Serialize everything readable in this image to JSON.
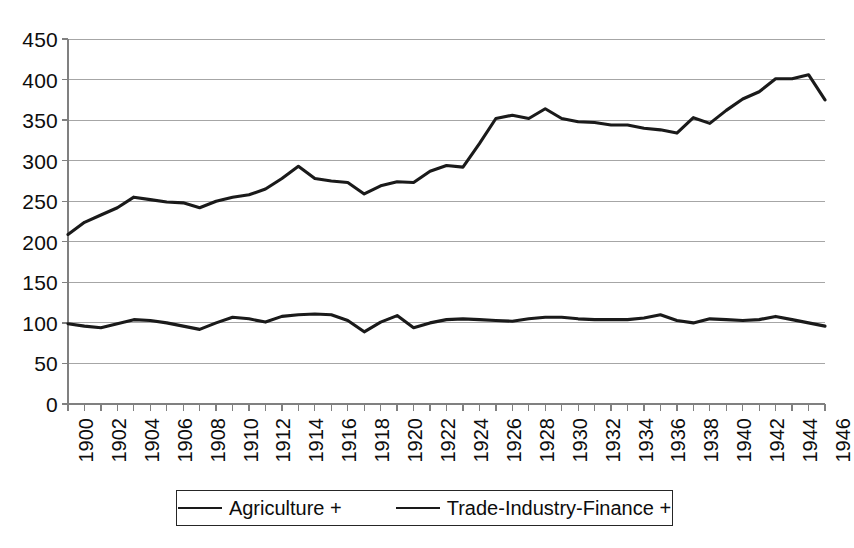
{
  "chart_data": {
    "type": "line",
    "title": "",
    "subtitle": "",
    "xlabel": "",
    "ylabel": "",
    "xlim": [
      1900,
      1946
    ],
    "ylim": [
      0,
      450
    ],
    "y_ticks": [
      0,
      50,
      100,
      150,
      200,
      250,
      300,
      350,
      400,
      450
    ],
    "y_tick_labels": [
      "0",
      "50",
      "100",
      "150",
      "200",
      "250",
      "300",
      "350",
      "400",
      "450"
    ],
    "x_tick_labels": [
      "1900",
      "1902",
      "1904",
      "1906",
      "1908",
      "1910",
      "1912",
      "1914",
      "1916",
      "1918",
      "1920",
      "1922",
      "1924",
      "1926",
      "1928",
      "1930",
      "1932",
      "1934",
      "1936",
      "1938",
      "1940",
      "1942",
      "1944",
      "1946"
    ],
    "x": [
      1900,
      1901,
      1902,
      1903,
      1904,
      1905,
      1906,
      1907,
      1908,
      1909,
      1910,
      1911,
      1912,
      1913,
      1914,
      1915,
      1916,
      1917,
      1918,
      1919,
      1920,
      1921,
      1922,
      1923,
      1924,
      1925,
      1926,
      1927,
      1928,
      1929,
      1930,
      1931,
      1932,
      1933,
      1934,
      1935,
      1936,
      1937,
      1938,
      1939,
      1940,
      1941,
      1942,
      1943,
      1944,
      1945,
      1946
    ],
    "grid": true,
    "grid_axis": "y",
    "legend_position": "bottom",
    "line_color": "#1a1a1a",
    "grid_color": "#a6a6a6",
    "axis_color": "#808080",
    "series": [
      {
        "name": "Agriculture +",
        "values": [
          99,
          96,
          94,
          99,
          104,
          103,
          100,
          96,
          92,
          100,
          107,
          105,
          101,
          108,
          110,
          111,
          110,
          103,
          89,
          101,
          109,
          94,
          100,
          104,
          105,
          104,
          103,
          102,
          105,
          107,
          107,
          105,
          104,
          104,
          104,
          106,
          110,
          103,
          100,
          105,
          104,
          103,
          104,
          108,
          104,
          100,
          96
        ]
      },
      {
        "name": "Trade-Industry-Finance +",
        "values": [
          209,
          224,
          233,
          242,
          255,
          252,
          249,
          248,
          242,
          250,
          255,
          258,
          265,
          278,
          293,
          278,
          275,
          273,
          259,
          269,
          274,
          273,
          287,
          294,
          292,
          321,
          352,
          356,
          352,
          364,
          352,
          348,
          347,
          344,
          344,
          340,
          338,
          334,
          353,
          346,
          362,
          376,
          385,
          401,
          401,
          406,
          375
        ]
      }
    ]
  },
  "legend": {
    "items": [
      {
        "label": "Agriculture +"
      },
      {
        "label": "Trade-Industry-Finance +"
      }
    ]
  }
}
